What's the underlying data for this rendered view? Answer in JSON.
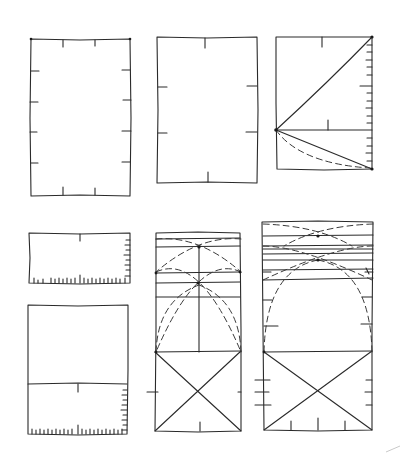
{
  "figure": {
    "title": "",
    "ink_color": "#2a2a2a",
    "background": "#ffffff"
  },
  "panels": [
    {
      "id": "panel-1",
      "label": "",
      "kind": "rectangle-with-ticks",
      "box": [
        31,
        39,
        130,
        196
      ]
    },
    {
      "id": "panel-2",
      "label": "",
      "kind": "rectangle-with-ticks",
      "box": [
        157,
        37,
        257,
        183
      ]
    },
    {
      "id": "panel-3",
      "label": "",
      "kind": "rectangle-with-diagonals-and-scale",
      "box": [
        276,
        37,
        372,
        169
      ],
      "divider_y": 130
    },
    {
      "id": "panel-4",
      "label": "",
      "kind": "short-rectangle-with-scale",
      "box": [
        29,
        233,
        130,
        283
      ]
    },
    {
      "id": "panel-5",
      "label": "",
      "kind": "rectangle-split-with-scale",
      "box": [
        28,
        305,
        128,
        434
      ],
      "divider_y": 384
    },
    {
      "id": "panel-6",
      "label": "",
      "kind": "arcs-and-cross-square",
      "box": [
        156,
        233,
        241,
        431
      ],
      "square_top": 352
    },
    {
      "id": "panel-7",
      "label": "",
      "kind": "arcs-and-cross-square",
      "box": [
        262,
        222,
        373,
        430
      ],
      "square_top": 352
    }
  ]
}
